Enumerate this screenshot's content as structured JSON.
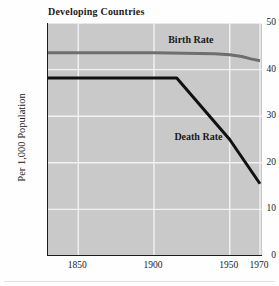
{
  "chart_data": {
    "type": "line",
    "title": "Developing Countries",
    "xlabel": "",
    "ylabel": "Per 1,000 Population",
    "xlim": [
      1830,
      1972
    ],
    "ylim": [
      0,
      50
    ],
    "xticks": [
      1850,
      1900,
      1950,
      1970
    ],
    "xtick_labels": [
      "1850",
      "1900",
      "1950",
      "1970"
    ],
    "yticks": [
      0,
      10,
      20,
      30,
      40,
      50
    ],
    "ytick_labels": [
      "0",
      "10",
      "20",
      "30",
      "40",
      "50"
    ],
    "grid": true,
    "grid_color": "#f2f2f2",
    "plot_background": "#c9c9c9",
    "legend": "inline-annotations",
    "series": [
      {
        "name": "Birth Rate",
        "color": "#6e6e6e",
        "label_x": 1925,
        "label_y": 46.2,
        "x": [
          1830,
          1850,
          1880,
          1900,
          1920,
          1940,
          1950,
          1958,
          1964,
          1970
        ],
        "values": [
          43.6,
          43.6,
          43.6,
          43.6,
          43.5,
          43.4,
          43.2,
          42.8,
          42.3,
          41.9
        ]
      },
      {
        "name": "Death Rate",
        "color": "#111111",
        "label_x": 1930,
        "label_y": 25.4,
        "x": [
          1830,
          1850,
          1900,
          1915,
          1950,
          1970
        ],
        "values": [
          38.2,
          38.2,
          38.2,
          38.2,
          25.0,
          15.5
        ]
      }
    ]
  },
  "chart": {
    "title": "Developing Countries",
    "ylabel": "Per 1,000 Population"
  }
}
